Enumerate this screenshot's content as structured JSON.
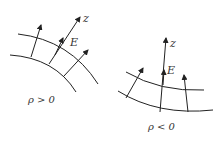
{
  "diagram": {
    "left_panel": {
      "axis_label": "z",
      "field_label": "E",
      "caption": "ρ > 0"
    },
    "right_panel": {
      "axis_label": "z",
      "field_label": "E",
      "caption": "ρ < 0"
    }
  }
}
